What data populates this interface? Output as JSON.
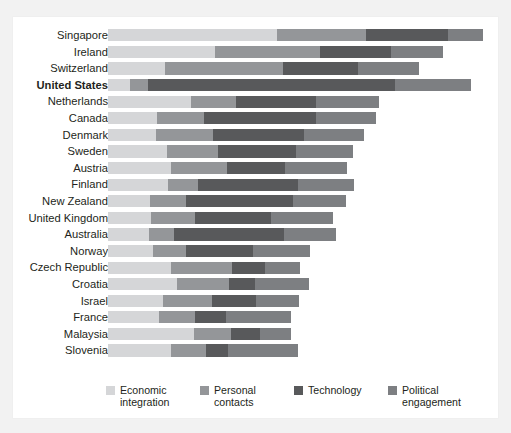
{
  "chart_data": {
    "type": "bar",
    "orientation": "horizontal",
    "stacked": true,
    "title": "",
    "subtitle": "",
    "xlabel": "",
    "ylabel": "",
    "grid": false,
    "legend_position": "bottom",
    "xlim": [
      0,
      100
    ],
    "categories": [
      "Singapore",
      "Ireland",
      "Switzerland",
      "United States",
      "Netherlands",
      "Canada",
      "Denmark",
      "Sweden",
      "Austria",
      "Finland",
      "New Zealand",
      "United Kingdom",
      "Australia",
      "Norway",
      "Czech Republic",
      "Croatia",
      "Israel",
      "France",
      "Malaysia",
      "Slovenia"
    ],
    "highlighted_category": "United States",
    "series": [
      {
        "name": "Economic integration",
        "color": "#d5d6d8",
        "values": [
          44.5,
          28.2,
          15.0,
          5.8,
          21.9,
          12.9,
          12.6,
          15.5,
          16.6,
          15.8,
          11.1,
          11.3,
          10.8,
          11.9,
          16.6,
          18.2,
          14.5,
          13.4,
          22.6,
          16.6
        ]
      },
      {
        "name": "Personal contacts",
        "color": "#949699",
        "values": [
          23.4,
          27.6,
          31.1,
          4.7,
          11.8,
          12.4,
          15.0,
          13.4,
          14.7,
          7.9,
          9.5,
          11.6,
          6.6,
          8.7,
          16.1,
          13.7,
          12.9,
          9.5,
          9.7,
          9.2
        ]
      },
      {
        "name": "Technology",
        "color": "#58595b",
        "values": [
          21.6,
          18.7,
          19.7,
          65.0,
          21.1,
          29.5,
          23.9,
          20.5,
          15.3,
          26.3,
          28.2,
          20.0,
          28.9,
          17.6,
          8.7,
          6.8,
          11.6,
          8.2,
          7.6,
          5.8
        ]
      },
      {
        "name": "Political engagement",
        "color": "#7d7f82",
        "values": [
          9.2,
          13.7,
          16.1,
          20.0,
          16.6,
          15.8,
          15.8,
          15.0,
          16.3,
          14.7,
          13.9,
          16.3,
          13.7,
          15.0,
          9.2,
          14.2,
          11.3,
          17.1,
          8.2,
          18.4
        ]
      }
    ]
  },
  "legend": {
    "items": [
      {
        "label_line1": "Economic",
        "label_line2": "integration",
        "swatch_name": "legend-swatch-economic-integration"
      },
      {
        "label_line1": "Personal",
        "label_line2": "contacts",
        "swatch_name": "legend-swatch-personal-contacts"
      },
      {
        "label_line1": "Technology",
        "label_line2": "",
        "swatch_name": "legend-swatch-technology"
      },
      {
        "label_line1": "Political",
        "label_line2": "engagement",
        "swatch_name": "legend-swatch-political-engagement"
      }
    ]
  },
  "colors": {
    "background": "#f2f2f2",
    "panel": "#ffffff",
    "text": "#231f20",
    "economic_integration": "#d5d6d8",
    "personal_contacts": "#949699",
    "technology": "#58595b",
    "political_engagement": "#7d7f82"
  }
}
